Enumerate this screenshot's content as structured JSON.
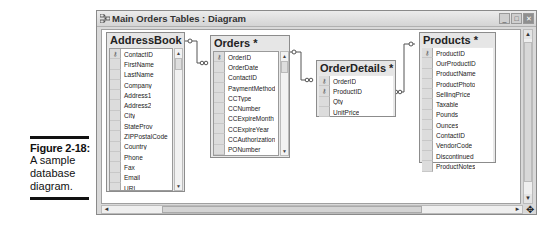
{
  "caption": {
    "figure_label": "Figure 2-18:",
    "description_lines": [
      "A sample",
      "database",
      "diagram."
    ]
  },
  "window": {
    "title": "Main Orders Tables : Diagram",
    "icon": "diagram-icon",
    "controls": {
      "minimize": "_",
      "maximize": "□",
      "close": "✕"
    }
  },
  "tables": {
    "addressbook": {
      "name": "AddressBook *",
      "fields": [
        "ContactID",
        "FirstName",
        "LastName",
        "Company",
        "Address1",
        "Address2",
        "City",
        "StateProv",
        "ZIPPostalCode",
        "Country",
        "Phone",
        "Fax",
        "Email",
        "URL",
        "ContactType",
        "DateEntered"
      ],
      "key_fields": [
        "ContactID"
      ]
    },
    "orders": {
      "name": "Orders *",
      "fields": [
        "OrderID",
        "OrderDate",
        "ContactID",
        "PaymentMethod",
        "CCType",
        "CCNumber",
        "CCExpireMonth",
        "CCExpireYear",
        "CCAuthorization",
        "PONumber",
        "Paid",
        "SalesTaxRateApplied"
      ],
      "key_fields": [
        "OrderID"
      ]
    },
    "orderdetails": {
      "name": "OrderDetails *",
      "fields": [
        "OrderID",
        "ProductID",
        "Qty",
        "UnitPrice"
      ],
      "key_fields": [
        "OrderID",
        "ProductID"
      ]
    },
    "products": {
      "name": "Products *",
      "fields": [
        "ProductID",
        "OurProductID",
        "ProductName",
        "ProductPhoto",
        "SellingPrice",
        "Taxable",
        "Pounds",
        "Ounces",
        "ContactID",
        "VendorCode",
        "Discontinued",
        "ProductNotes"
      ],
      "key_fields": [
        "ProductID"
      ]
    }
  },
  "relationships": [
    {
      "from": "AddressBook.ContactID",
      "to": "Orders.ContactID",
      "type": "one-to-many"
    },
    {
      "from": "Orders.OrderID",
      "to": "OrderDetails.OrderID",
      "type": "one-to-many"
    },
    {
      "from": "Products.ProductID",
      "to": "OrderDetails.ProductID",
      "type": "one-to-many"
    }
  ],
  "glyphs": {
    "key": "⚷",
    "up": "▲",
    "down": "▼",
    "left": "◄",
    "right": "►",
    "move": "✥"
  }
}
